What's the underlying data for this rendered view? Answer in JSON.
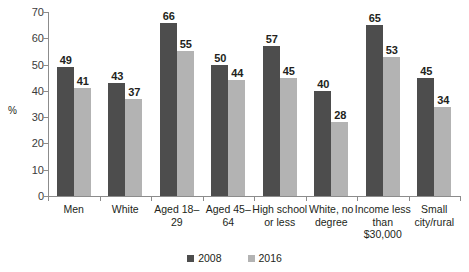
{
  "chart_data": {
    "type": "bar",
    "title": "",
    "subtitle": "",
    "xlabel": "",
    "ylabel": "%",
    "ylim": [
      0,
      70
    ],
    "yticks": [
      0,
      10,
      20,
      30,
      40,
      50,
      60,
      70
    ],
    "grid": false,
    "legend_position": "bottom-center",
    "categories": [
      "Men",
      "White",
      "Aged 18–29",
      "Aged 45–64",
      "High school or less",
      "White, no degree",
      "Income less than $30,000",
      "Small city/rural"
    ],
    "category_lines": [
      [
        "Men"
      ],
      [
        "White"
      ],
      [
        "Aged 18–",
        "29"
      ],
      [
        "Aged 45–",
        "64"
      ],
      [
        "High school",
        "or less"
      ],
      [
        "White, no",
        "degree"
      ],
      [
        "Income less",
        "than",
        "$30,000"
      ],
      [
        "Small",
        "city/rural"
      ]
    ],
    "series": [
      {
        "name": "2008",
        "color": "#4d4d4d",
        "values": [
          49,
          43,
          66,
          50,
          57,
          40,
          65,
          45
        ]
      },
      {
        "name": "2016",
        "color": "#b3b3b3",
        "values": [
          41,
          37,
          55,
          44,
          45,
          28,
          53,
          34
        ]
      }
    ]
  },
  "legend": {
    "items": [
      {
        "label": "2008",
        "color": "#4d4d4d"
      },
      {
        "label": "2016",
        "color": "#b3b3b3"
      }
    ]
  },
  "axis": {
    "y_title": "%",
    "axis_color": "#8c8c8c"
  }
}
